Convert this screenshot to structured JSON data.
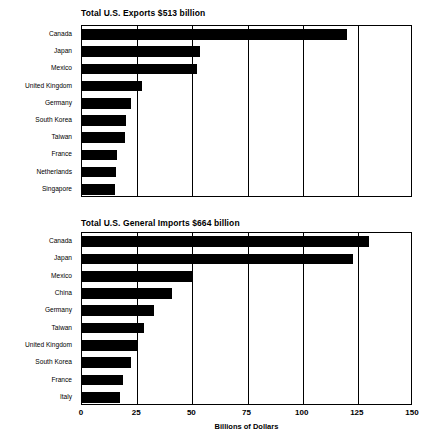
{
  "chart_data": [
    {
      "type": "bar",
      "orientation": "horizontal",
      "title": "Total U.S. Exports $513 billion",
      "xlabel": "",
      "ylabel": "",
      "xlim": [
        0,
        150
      ],
      "xticks": [
        0,
        25,
        50,
        75,
        100,
        125,
        150
      ],
      "xtick_labels": [
        "0",
        "25",
        "50",
        "75",
        "100",
        "125",
        "150"
      ],
      "grid": "vertical",
      "units": "Billions of Dollars",
      "categories": [
        "Canada",
        "Japan",
        "Mexico",
        "United Kingdom",
        "Germany",
        "South Korea",
        "Taiwan",
        "France",
        "Netherlands",
        "Singapore"
      ],
      "values": [
        120,
        53.5,
        52,
        27,
        22,
        20,
        19.5,
        16,
        15.5,
        15
      ]
    },
    {
      "type": "bar",
      "orientation": "horizontal",
      "title": "Total U.S. General Imports $664 billion",
      "xlabel": "Billions of Dollars",
      "ylabel": "",
      "xlim": [
        0,
        150
      ],
      "xticks": [
        0,
        25,
        50,
        75,
        100,
        125,
        150
      ],
      "xtick_labels": [
        "0",
        "25",
        "50",
        "75",
        "100",
        "125",
        "150"
      ],
      "grid": "vertical",
      "units": "Billions of Dollars",
      "categories": [
        "Canada",
        "Japan",
        "Mexico",
        "China",
        "Germany",
        "Taiwan",
        "United Kingdom",
        "South Korea",
        "France",
        "Italy"
      ],
      "values": [
        130,
        123,
        50,
        41,
        32.5,
        28,
        25.5,
        22,
        18.5,
        17
      ]
    }
  ],
  "axis": {
    "label": "Billions of Dollars",
    "ticks": [
      "0",
      "25",
      "50",
      "75",
      "100",
      "125",
      "150"
    ]
  },
  "panels": {
    "exports": {
      "title": "Total U.S. Exports $513 billion",
      "categories": [
        "Canada",
        "Japan",
        "Mexico",
        "United Kingdom",
        "Germany",
        "South Korea",
        "Taiwan",
        "France",
        "Netherlands",
        "Singapore"
      ]
    },
    "imports": {
      "title": "Total U.S. General Imports $664 billion",
      "categories": [
        "Canada",
        "Japan",
        "Mexico",
        "China",
        "Germany",
        "Taiwan",
        "United Kingdom",
        "South Korea",
        "France",
        "Italy"
      ]
    }
  },
  "colors": {
    "bar": "#000000",
    "axis": "#000000",
    "background": "#ffffff"
  }
}
